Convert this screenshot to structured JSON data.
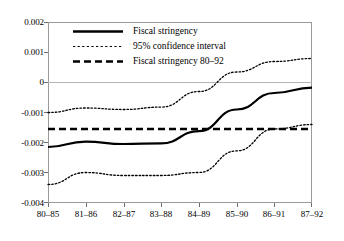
{
  "chart_data": {
    "type": "line",
    "title": "",
    "subtitle": "",
    "xlabel": "",
    "ylabel": "",
    "categories": [
      "80–85",
      "81–86",
      "82–87",
      "83–88",
      "84–89",
      "85–90",
      "86–91",
      "87–92"
    ],
    "ylim": [
      -0.004,
      0.002
    ],
    "yticks": [
      0.002,
      0.001,
      0,
      -0.001,
      -0.002,
      -0.003,
      -0.004
    ],
    "ytick_labels": [
      "0.002",
      "0.001",
      "0",
      "-0.001",
      "-0.002",
      "-0.003",
      "-0.004"
    ],
    "grid": false,
    "zero_line": true,
    "legend_position": "top-left",
    "series": [
      {
        "name": "Fiscal stringency",
        "style": "solid",
        "color": "#000000",
        "values": [
          -0.00215,
          -0.00197,
          -0.00205,
          -0.00203,
          -0.00162,
          -0.0009,
          -0.00035,
          -0.00017
        ]
      },
      {
        "name": "95% confidence interval",
        "style": "dotted",
        "color": "#000000",
        "bound": "upper",
        "values": [
          -0.001,
          -0.00085,
          -0.0009,
          -0.00082,
          -0.0003,
          0.00035,
          0.0007,
          0.0008
        ]
      },
      {
        "name": "95% confidence interval",
        "style": "dotted",
        "color": "#000000",
        "bound": "lower",
        "values": [
          -0.0034,
          -0.003,
          -0.0031,
          -0.0031,
          -0.003,
          -0.00228,
          -0.00155,
          -0.0014
        ]
      },
      {
        "name": "Fiscal stringency 80–92",
        "style": "dashed",
        "color": "#000000",
        "constant": -0.00155,
        "values": [
          -0.00155,
          -0.00155,
          -0.00155,
          -0.00155,
          -0.00155,
          -0.00155,
          -0.00155,
          -0.00155
        ]
      }
    ]
  },
  "legend": {
    "items": [
      {
        "label": "Fiscal stringency",
        "style": "solid"
      },
      {
        "label": "95% confidence interval",
        "style": "dotted"
      },
      {
        "label": "Fiscal stringency 80–92",
        "style": "dashed"
      }
    ]
  },
  "colors": {
    "line": "#000000",
    "axis": "#9a9a9a",
    "zero_line": "#b4b4b4",
    "background": "#ffffff"
  }
}
